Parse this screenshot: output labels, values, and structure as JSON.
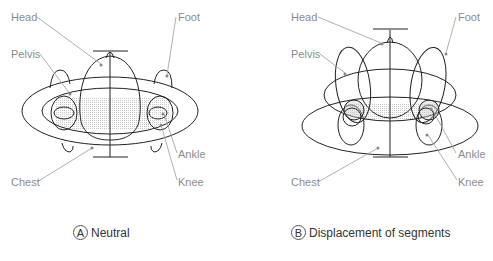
{
  "panels": [
    {
      "id": "A",
      "caption": "Neutral",
      "labels": {
        "head": "Head",
        "foot": "Foot",
        "pelvis": "Pelvis",
        "chest": "Chest",
        "ankle": "Ankle",
        "knee": "Knee"
      }
    },
    {
      "id": "B",
      "caption": "Displacement of segments",
      "labels": {
        "head": "Head",
        "foot": "Foot",
        "pelvis": "Pelvis",
        "chest": "Chest",
        "ankle": "Ankle",
        "knee": "Knee"
      }
    }
  ],
  "colors": {
    "outline": "#222222",
    "leader": "#9a9a9a",
    "label": "#8c8c8c",
    "hatch": "#cccccc"
  }
}
